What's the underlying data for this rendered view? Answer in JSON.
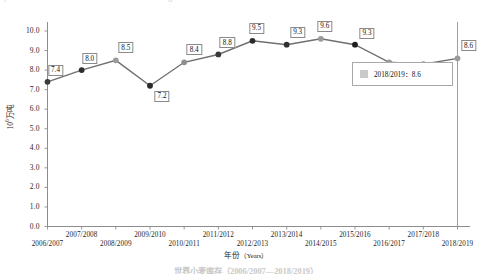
{
  "top_clipped": {
    "left_fragment": "|",
    "right_fragment": "g"
  },
  "caption": {
    "text": "世界小麦库存（2006/2007—2018/2019）"
  },
  "legend": {
    "swatch_color": "#c9c9c9",
    "entry": "2018/2019：8.6"
  },
  "axes": {
    "ylabel_prefix": "10",
    "ylabel_sup": "6",
    "ylabel_suffix": "万吨",
    "xlabel_cn": "年份",
    "xlabel_en": "（Years）",
    "yticks": [
      "10.0",
      "9.0",
      "8.0",
      "7.0",
      "6.0",
      "5.0",
      "4.0",
      "3.0",
      "2.0",
      "1.0",
      "0.0"
    ]
  },
  "chart_data": {
    "type": "line",
    "title": "",
    "xlabel": "年份（Years）",
    "ylabel": "10^6万吨",
    "ylim": [
      0.0,
      10.0
    ],
    "ytick_step": 1.0,
    "grid": false,
    "legend_position": "center-right",
    "categories": [
      "2006/2007",
      "2007/2008",
      "2008/2009",
      "2009/2010",
      "2010/2011",
      "2011/2012",
      "2012/2013",
      "2013/2014",
      "2014/2015",
      "2015/2016",
      "2016/2017",
      "2017/2018",
      "2018/2019"
    ],
    "values": [
      7.4,
      8.0,
      8.5,
      7.2,
      8.4,
      8.8,
      9.5,
      9.3,
      9.6,
      9.3,
      8.4,
      8.3,
      8.6
    ],
    "data_labels": [
      "7.4",
      "8.0",
      "8.5",
      "7.2",
      "8.4",
      "8.8",
      "9.5",
      "9.3",
      "9.6",
      "9.3",
      "8.4",
      "8.3",
      "8.6"
    ],
    "marker_colors": [
      "#3b3b3b",
      "#2e2e2e",
      "#9a9a9a",
      "#2a2a2a",
      "#8f8f8f",
      "#3a3a3a",
      "#2b2b2b",
      "#303030",
      "#9a9a9a",
      "#1f1f1f",
      "#9a9a9a",
      "#8f8f8f",
      "#9a9a9a"
    ],
    "line_color": "#6f6f6f",
    "series": [
      {
        "name": "2018/2019",
        "values": [
          7.4,
          8.0,
          8.5,
          7.2,
          8.4,
          8.8,
          9.5,
          9.3,
          9.6,
          9.3,
          8.4,
          8.3,
          8.6
        ]
      }
    ]
  }
}
